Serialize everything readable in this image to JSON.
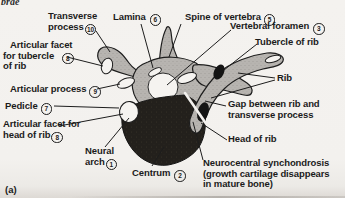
{
  "figure": {
    "corner_fragment": "brae",
    "panel_label": "(a)"
  },
  "colors": {
    "paper": "#f3f1ee",
    "ink": "#1b1b1b",
    "bone_gray": "#b7b4b0",
    "centrum_dark": "#23201c"
  },
  "labels": {
    "transverse_process": {
      "line1": "Transverse",
      "line2": "process",
      "num": "10"
    },
    "lamina": {
      "line1": "Lamina",
      "num": "6"
    },
    "spine_of_vertebra": {
      "line1": "Spine of vertebra",
      "num": "5"
    },
    "vertebral_foramen": {
      "line1": "Vertebral foramen",
      "num": "3"
    },
    "tubercle_of_rib": {
      "line1": "Tubercle of rib"
    },
    "articular_facet_tubercle": {
      "line1": "Articular facet",
      "line2": "for tubercle",
      "line3": "of rib",
      "num": "8"
    },
    "articular_process": {
      "line1": "Articular process",
      "num": "9"
    },
    "rib": {
      "line1": "Rib"
    },
    "pedicle": {
      "line1": "Pedicle",
      "num": "7"
    },
    "gap_rib_transverse": {
      "line1": "Gap between rib and",
      "line2": "transverse process"
    },
    "articular_facet_head": {
      "line1": "Articular facet for",
      "line2": "head of rib",
      "num": "8"
    },
    "head_of_rib": {
      "line1": "Head of rib"
    },
    "neural_arch": {
      "line1": "Neural",
      "line2": "arch",
      "num": "1"
    },
    "neurocentral": {
      "line1": "Neurocentral synchondrosis",
      "line2": "(growth cartilage disappears",
      "line3": "in mature bone)"
    },
    "centrum": {
      "line1": "Centrum",
      "num": "2"
    }
  }
}
